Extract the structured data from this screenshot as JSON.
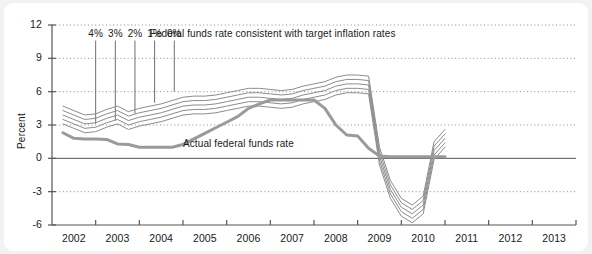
{
  "chart_data": {
    "type": "line",
    "title": "",
    "xlabel": "",
    "ylabel": "Percent",
    "ylim": [
      -6,
      12
    ],
    "xlim": [
      2001.5,
      2013.5
    ],
    "yticks": [
      "12",
      "9",
      "6",
      "3",
      "0",
      "-3",
      "-6"
    ],
    "ytick_values": [
      12,
      9,
      6,
      3,
      0,
      -3,
      -6
    ],
    "xticks": [
      "2002",
      "2003",
      "2004",
      "2005",
      "2006",
      "2007",
      "2008",
      "2009",
      "2010",
      "2011",
      "2012",
      "2013"
    ],
    "xtick_values": [
      2002,
      2003,
      2004,
      2005,
      2006,
      2007,
      2008,
      2009,
      2010,
      2011,
      2012,
      2013
    ],
    "grid": "horizontal dotted at 12, 9, 6, 3, -3; solid zero line at 0",
    "legend_position": "inline annotations",
    "annotations": [
      {
        "text": "Federal funds rate consistent with target inflation rates",
        "x": 2003.6,
        "y": 11.2
      },
      {
        "text": "Actual federal funds rate",
        "x": 2004.5,
        "y": 1.2
      }
    ],
    "scenario_labels": [
      "4%",
      "3%",
      "2%",
      "1%",
      "0%"
    ],
    "x": [
      2001.75,
      2002.0,
      2002.25,
      2002.5,
      2002.75,
      2003.0,
      2003.25,
      2003.5,
      2003.75,
      2004.0,
      2004.25,
      2004.5,
      2004.75,
      2005.0,
      2005.25,
      2005.5,
      2005.75,
      2006.0,
      2006.25,
      2006.5,
      2006.75,
      2007.0,
      2007.25,
      2007.5,
      2007.75,
      2008.0,
      2008.25,
      2008.5,
      2008.75,
      2009.0,
      2009.25,
      2009.5,
      2009.75,
      2010.0,
      2010.25,
      2010.5
    ],
    "series": [
      {
        "name": "Target inflation 4%",
        "color": "#8c8c8c",
        "width": 1,
        "values": [
          4.7,
          4.3,
          3.9,
          4.0,
          4.4,
          4.7,
          4.2,
          4.5,
          4.7,
          4.9,
          5.2,
          5.5,
          5.6,
          5.6,
          5.7,
          5.9,
          6.1,
          6.3,
          6.3,
          6.2,
          6.1,
          6.2,
          6.5,
          6.7,
          6.9,
          7.3,
          7.5,
          7.5,
          7.4,
          1.0,
          -2.0,
          -3.6,
          -4.2,
          -3.4,
          1.5,
          2.6
        ]
      },
      {
        "name": "Target inflation 3%",
        "color": "#8c8c8c",
        "width": 1,
        "values": [
          4.3,
          3.9,
          3.5,
          3.6,
          4.0,
          4.3,
          3.8,
          4.1,
          4.3,
          4.5,
          4.8,
          5.1,
          5.2,
          5.2,
          5.3,
          5.5,
          5.7,
          5.9,
          5.9,
          5.8,
          5.7,
          5.8,
          6.1,
          6.3,
          6.5,
          6.9,
          7.1,
          7.1,
          7.0,
          0.6,
          -2.4,
          -4.0,
          -4.6,
          -3.8,
          1.1,
          2.2
        ]
      },
      {
        "name": "Target inflation 2%",
        "color": "#8c8c8c",
        "width": 1,
        "values": [
          3.9,
          3.5,
          3.1,
          3.2,
          3.6,
          3.9,
          3.4,
          3.7,
          3.9,
          4.1,
          4.4,
          4.7,
          4.8,
          4.8,
          4.9,
          5.1,
          5.3,
          5.5,
          5.5,
          5.4,
          5.3,
          5.4,
          5.7,
          5.9,
          6.1,
          6.5,
          6.7,
          6.7,
          6.6,
          0.2,
          -2.8,
          -4.4,
          -5.0,
          -4.2,
          0.7,
          1.8
        ]
      },
      {
        "name": "Target inflation 1%",
        "color": "#8c8c8c",
        "width": 1,
        "values": [
          3.5,
          3.1,
          2.7,
          2.8,
          3.2,
          3.5,
          3.0,
          3.3,
          3.5,
          3.7,
          4.0,
          4.3,
          4.4,
          4.4,
          4.5,
          4.7,
          4.9,
          5.1,
          5.1,
          5.0,
          4.9,
          5.0,
          5.3,
          5.5,
          5.7,
          6.1,
          6.3,
          6.3,
          6.2,
          -0.2,
          -3.2,
          -4.8,
          -5.4,
          -4.6,
          0.3,
          1.4
        ]
      },
      {
        "name": "Target inflation 0%",
        "color": "#8c8c8c",
        "width": 1,
        "values": [
          3.1,
          2.7,
          2.3,
          2.4,
          2.8,
          3.1,
          2.6,
          2.9,
          3.1,
          3.3,
          3.6,
          3.9,
          4.0,
          4.0,
          4.1,
          4.3,
          4.5,
          4.7,
          4.7,
          4.6,
          4.5,
          4.6,
          4.9,
          5.1,
          5.3,
          5.7,
          5.9,
          5.9,
          5.8,
          -0.6,
          -3.6,
          -5.2,
          -5.8,
          -5.0,
          -0.1,
          1.0
        ]
      },
      {
        "name": "Actual federal funds rate",
        "color": "#9a9a9a",
        "width": 3,
        "values": [
          2.3,
          1.8,
          1.75,
          1.75,
          1.7,
          1.3,
          1.25,
          1.0,
          1.0,
          1.0,
          1.0,
          1.25,
          1.75,
          2.25,
          2.75,
          3.25,
          3.75,
          4.5,
          4.9,
          5.25,
          5.25,
          5.25,
          5.25,
          5.25,
          4.5,
          3.0,
          2.1,
          2.0,
          0.9,
          0.2,
          0.15,
          0.15,
          0.15,
          0.15,
          0.15,
          0.15
        ]
      }
    ],
    "scenario_pointers": [
      {
        "label": "4%",
        "x": 2002.5,
        "y_end": 3.1
      },
      {
        "label": "3%",
        "x": 2002.95,
        "y_end": 3.4
      },
      {
        "label": "2%",
        "x": 2003.4,
        "y_end": 4.0
      },
      {
        "label": "1%",
        "x": 2003.85,
        "y_end": 5.0
      },
      {
        "label": "0%",
        "x": 2004.3,
        "y_end": 6.0
      }
    ]
  },
  "colors": {
    "background": "#f2f2f2",
    "card": "#ffffff",
    "axis": "#555555",
    "grid": "#8c8c8c",
    "scenario_line": "#8c8c8c",
    "actual_line": "#9a9a9a",
    "text": "#1a1a1a"
  }
}
